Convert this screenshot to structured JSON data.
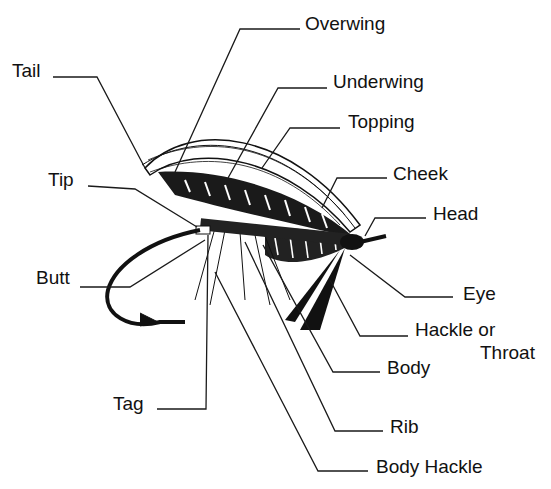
{
  "diagram": {
    "colors": {
      "ink": "#111111",
      "background": "#ffffff"
    },
    "labels": [
      {
        "id": "overwing",
        "text": "Overwing",
        "x": 305,
        "y": 30
      },
      {
        "id": "underwing",
        "text": "Underwing",
        "x": 333,
        "y": 88
      },
      {
        "id": "topping",
        "text": "Topping",
        "x": 348,
        "y": 128
      },
      {
        "id": "tail",
        "text": "Tail",
        "x": 12,
        "y": 77
      },
      {
        "id": "tip",
        "text": "Tip",
        "x": 48,
        "y": 186
      },
      {
        "id": "cheek",
        "text": "Cheek",
        "x": 393,
        "y": 180
      },
      {
        "id": "head",
        "text": "Head",
        "x": 433,
        "y": 220
      },
      {
        "id": "butt",
        "text": "Butt",
        "x": 36,
        "y": 284
      },
      {
        "id": "eye",
        "text": "Eye",
        "x": 463,
        "y": 300
      },
      {
        "id": "hackle",
        "text": "Hackle or",
        "x": 415,
        "y": 336
      },
      {
        "id": "throat",
        "text": "Throat",
        "x": 480,
        "y": 359
      },
      {
        "id": "body",
        "text": "Body",
        "x": 387,
        "y": 374
      },
      {
        "id": "tag",
        "text": "Tag",
        "x": 113,
        "y": 410
      },
      {
        "id": "rib",
        "text": "Rib",
        "x": 390,
        "y": 433
      },
      {
        "id": "body_hackle",
        "text": "Body Hackle",
        "x": 376,
        "y": 473
      }
    ]
  }
}
